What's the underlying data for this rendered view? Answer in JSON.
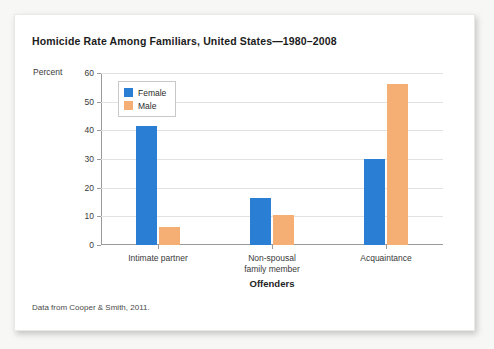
{
  "figure": {
    "title": "Homicide Rate Among Familiars, United States—1980–2008",
    "source_note": "Data from Cooper & Smith, 2011."
  },
  "colors": {
    "female": "#2a7fd4",
    "male": "#f5ae74",
    "gridline": "#e2e2e2",
    "axis": "#9a9a9a",
    "card_background": "#ffffff",
    "page_background": "#f7f7f5"
  },
  "chart_data": {
    "type": "bar",
    "title": "Homicide Rate Among Familiars, United States—1980–2008",
    "xlabel": "Offenders",
    "ylabel": "Percent",
    "categories": [
      "Intimate partner",
      "Non-spousal family member",
      "Acquaintance"
    ],
    "category_lines": [
      [
        "Intimate partner"
      ],
      [
        "Non-spousal",
        "family member"
      ],
      [
        "Acquaintance"
      ]
    ],
    "series": [
      {
        "name": "Female",
        "color": "#2a7fd4",
        "values": [
          41.5,
          16.5,
          30.0
        ]
      },
      {
        "name": "Male",
        "color": "#f5ae74",
        "values": [
          6.4,
          10.6,
          56.3
        ]
      }
    ],
    "ylim": [
      0,
      60
    ],
    "yticks": [
      0,
      10,
      20,
      30,
      40,
      50,
      60
    ],
    "ytick_labels": [
      "0",
      "10",
      "20",
      "30",
      "40",
      "50",
      "60"
    ],
    "grid": true,
    "legend_position": "top-left",
    "legend": [
      "Female",
      "Male"
    ]
  }
}
